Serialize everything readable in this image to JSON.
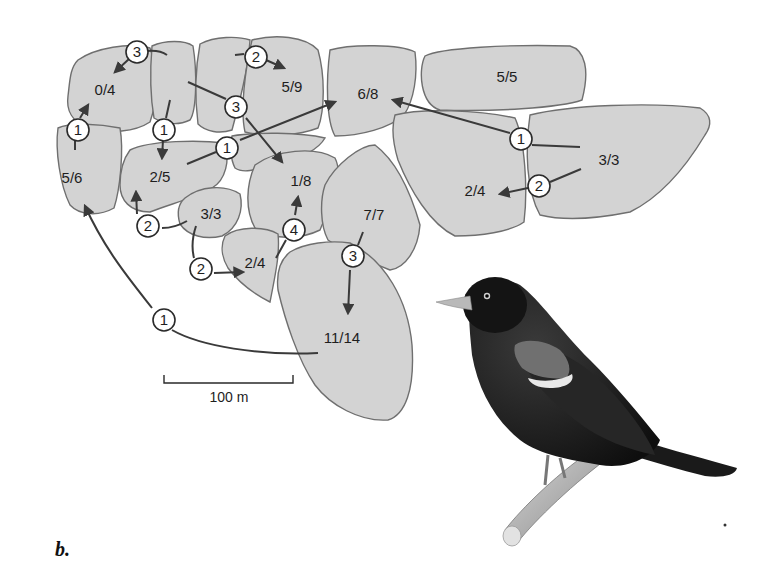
{
  "figure": {
    "panel_label": "b.",
    "scale_bar": {
      "label": "100 m"
    },
    "territories": [
      {
        "id": "t1",
        "label": "0/4"
      },
      {
        "id": "t2",
        "label": "5/9"
      },
      {
        "id": "t3",
        "label": "6/8"
      },
      {
        "id": "t4",
        "label": "5/5"
      },
      {
        "id": "t5",
        "label": "5/6"
      },
      {
        "id": "t6",
        "label": "2/5"
      },
      {
        "id": "t7",
        "label": "1/8"
      },
      {
        "id": "t8",
        "label": "3/3"
      },
      {
        "id": "t9",
        "label": "2/4"
      },
      {
        "id": "t10",
        "label": "7/7"
      },
      {
        "id": "t11",
        "label": "2/4"
      },
      {
        "id": "t12",
        "label": "3/3"
      },
      {
        "id": "t13",
        "label": "11/14"
      }
    ],
    "movements": [
      {
        "from": "top-middle",
        "to": "0/4",
        "count": "3"
      },
      {
        "from": "5/6",
        "to": "0/4",
        "count": "1"
      },
      {
        "from": "top-middle",
        "to": "2/5",
        "count": "1"
      },
      {
        "from": "top-left-middle",
        "to": "5/9",
        "count": "2"
      },
      {
        "from": "top-middle",
        "to": "1/8",
        "count": "3"
      },
      {
        "from": "2/5",
        "to": "6/8",
        "count": "1"
      },
      {
        "from": "3/3 (right)",
        "to": "6/8",
        "count": "1"
      },
      {
        "from": "3/3 (right)",
        "to": "2/4 (right)",
        "count": "2"
      },
      {
        "from": "3/3 (small)",
        "to": "2/5",
        "count": "2"
      },
      {
        "from": "3/3 (small)",
        "to": "2/4 (small)",
        "count": "2"
      },
      {
        "from": "2/4 (small)",
        "to": "1/8",
        "count": "4"
      },
      {
        "from": "7/7",
        "to": "11/14",
        "count": "3"
      },
      {
        "from": "11/14",
        "to": "5/6",
        "count": "1"
      }
    ],
    "illustration": "red-winged-blackbird"
  }
}
